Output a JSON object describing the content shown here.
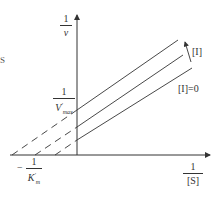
{
  "diagram": {
    "type": "lineweaver-burk-plot",
    "edge_fragment": "S",
    "y_axis": {
      "numerator": "1",
      "denominator": "v"
    },
    "x_axis": {
      "numerator": "1",
      "denominator": "[S]"
    },
    "y_intercept_label": {
      "numerator": "1",
      "denominator_main": "V",
      "denominator_prime": "′",
      "denominator_sub": "max"
    },
    "x_intercept_label": {
      "sign": "−",
      "numerator": "1",
      "denominator_main": "K",
      "denominator_prime": "′",
      "denominator_sub": "m"
    },
    "arrow_label": "[I]",
    "baseline_label": "[I]=0",
    "lines": [
      {
        "name": "high-inhibitor",
        "x_intercept_px": 12,
        "y_axis_px": 110,
        "end": [
          178,
          40
        ]
      },
      {
        "name": "mid-inhibitor",
        "x_intercept_px": 35,
        "y_axis_px": 127,
        "end": [
          183,
          55
        ]
      },
      {
        "name": "no-inhibitor",
        "x_intercept_px": 55,
        "y_axis_px": 140,
        "end": [
          192,
          68
        ]
      }
    ],
    "colors": {
      "ink": "#333333",
      "background": "#ffffff"
    }
  }
}
